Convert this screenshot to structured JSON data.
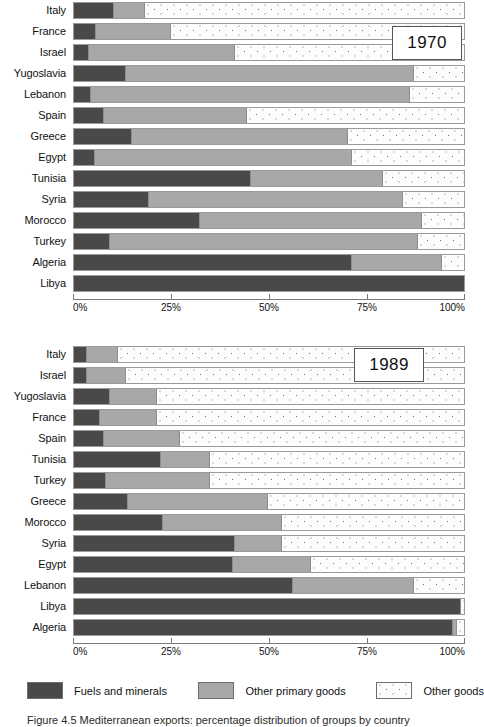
{
  "axis": {
    "ticks": [
      "0%",
      "25%",
      "50%",
      "75%",
      "100%"
    ],
    "tick_values": [
      0,
      25,
      50,
      75,
      100
    ]
  },
  "panels": [
    {
      "year_label": "1970"
    },
    {
      "year_label": "1989"
    }
  ],
  "legend": {
    "items": [
      {
        "key": "fuels",
        "label": "Fuels and minerals",
        "color": "#494949"
      },
      {
        "key": "primary",
        "label": "Other primary goods",
        "color": "#a8a8a8"
      },
      {
        "key": "other",
        "label": "Other goods",
        "color": "#fdfdfd"
      }
    ]
  },
  "caption": {
    "prefix": "Figure 4.5",
    "text": "Figure 4.5   Mediterranean exports: percentage distribution of groups by country"
  },
  "chart_data": [
    {
      "type": "bar",
      "subtype": "stacked-horizontal-100",
      "title": "1970",
      "xlabel": "",
      "ylabel": "",
      "xlim": [
        0,
        100
      ],
      "grid": false,
      "legend_position": "bottom",
      "categories": [
        "Italy",
        "France",
        "Israel",
        "Yugoslavia",
        "Lebanon",
        "Spain",
        "Greece",
        "Egypt",
        "Tunisia",
        "Syria",
        "Morocco",
        "Turkey",
        "Algeria",
        "Libya"
      ],
      "series": [
        {
          "name": "Fuels and minerals",
          "values": [
            10,
            5.5,
            3.5,
            13,
            4,
            7.5,
            14.5,
            5,
            45,
            19,
            32,
            9,
            71,
            100
          ]
        },
        {
          "name": "Other primary goods",
          "values": [
            8,
            19,
            37.5,
            74,
            82,
            36.5,
            55.5,
            66,
            34,
            65,
            57,
            79,
            23,
            0
          ]
        },
        {
          "name": "Other goods",
          "values": [
            82,
            75.5,
            59,
            13,
            14,
            56,
            30,
            29,
            21,
            16,
            11,
            12,
            6,
            0
          ]
        }
      ]
    },
    {
      "type": "bar",
      "subtype": "stacked-horizontal-100",
      "title": "1989",
      "xlabel": "",
      "ylabel": "",
      "xlim": [
        0,
        100
      ],
      "grid": false,
      "legend_position": "bottom",
      "categories": [
        "Italy",
        "Israel",
        "Yugoslavia",
        "France",
        "Spain",
        "Tunisia",
        "Turkey",
        "Greece",
        "Morocco",
        "Syria",
        "Egypt",
        "Lebanon",
        "Libya",
        "Algeria"
      ],
      "series": [
        {
          "name": "Fuels and minerals",
          "values": [
            3,
            3,
            9,
            6.5,
            7.5,
            22,
            8,
            13.5,
            22.5,
            41,
            40.5,
            56,
            99,
            97
          ]
        },
        {
          "name": "Other primary goods",
          "values": [
            8,
            10,
            12,
            14.5,
            19.5,
            12.5,
            26.5,
            36,
            30.5,
            12,
            20,
            31,
            0,
            1
          ]
        },
        {
          "name": "Other goods",
          "values": [
            89,
            87,
            79,
            79,
            73,
            65.5,
            65.5,
            50.5,
            47,
            47,
            39.5,
            13,
            1,
            2
          ]
        }
      ]
    }
  ]
}
